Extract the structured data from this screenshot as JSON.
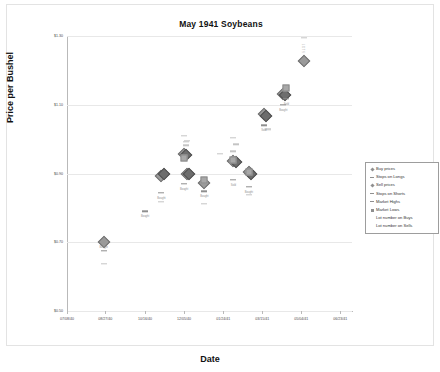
{
  "chart_data": {
    "type": "scatter",
    "title": "May 1941 Soybeans",
    "xlabel": "Date",
    "ylabel": "Price per Bushel",
    "grid": true,
    "legend_position": "right",
    "ylim": [
      0.5,
      1.3
    ],
    "y_ticks": [
      "$0.50",
      "$0.70",
      "$0.90",
      "$1.10",
      "$1.30"
    ],
    "y_tick_values": [
      0.5,
      0.7,
      0.9,
      1.1,
      1.3
    ],
    "x_ticks": [
      "07/08/40",
      "08/27/40",
      "10/16/40",
      "12/05/40",
      "01/24/41",
      "03/15/41",
      "05/04/41",
      "06/23/41"
    ],
    "x_tick_positions": [
      0,
      49,
      100,
      150,
      200,
      250,
      300,
      350
    ],
    "xlim": [
      0,
      365
    ],
    "legend": [
      {
        "label": "Buy prices",
        "key": "diamond"
      },
      {
        "label": "Stops on Longs",
        "key": "dash"
      },
      {
        "label": "Sell prices",
        "key": "diamond"
      },
      {
        "label": "Stops on Shorts",
        "key": "dash"
      },
      {
        "label": "Market Highs",
        "key": "dash"
      },
      {
        "label": "Market Lows",
        "key": "square"
      },
      {
        "label": "Lot number on Buys",
        "key": "blank"
      },
      {
        "label": "Lot number on Sells",
        "key": "blank"
      }
    ],
    "series": [
      {
        "name": "Buy prices",
        "marker": "diamond",
        "points": [
          {
            "x": 47,
            "y": 0.7,
            "label": "Bought"
          },
          {
            "x": 121,
            "y": 0.893,
            "label": "Bought"
          },
          {
            "x": 150,
            "y": 0.958,
            "label": "Bought"
          },
          {
            "x": 154,
            "y": 0.9,
            "label": "Bought"
          },
          {
            "x": 176,
            "y": 0.873,
            "label": "Bought"
          },
          {
            "x": 213,
            "y": 0.935,
            "label": "Bought"
          },
          {
            "x": 233,
            "y": 0.903,
            "label": "Bought"
          },
          {
            "x": 252,
            "y": 1.072,
            "label": "Bought"
          },
          {
            "x": 277,
            "y": 1.132,
            "label": "Bought"
          },
          {
            "x": 303,
            "y": 1.228,
            "label": "Bought"
          }
        ]
      },
      {
        "name": "Sell prices",
        "marker": "diamond-dark",
        "points": [
          {
            "x": 124,
            "y": 0.9,
            "label": "Sold"
          },
          {
            "x": 152,
            "y": 0.955,
            "label": "Sold"
          },
          {
            "x": 156,
            "y": 0.898,
            "label": "Sold"
          },
          {
            "x": 216,
            "y": 0.933,
            "label": "Sold"
          },
          {
            "x": 236,
            "y": 0.9,
            "label": "Sold"
          },
          {
            "x": 255,
            "y": 1.068,
            "label": "Sold"
          },
          {
            "x": 279,
            "y": 1.128,
            "label": "Sold"
          }
        ]
      },
      {
        "name": "Stops on Longs",
        "marker": "dash",
        "points": [
          {
            "x": 47,
            "y": 0.676
          },
          {
            "x": 100,
            "y": 0.79
          },
          {
            "x": 121,
            "y": 0.843
          },
          {
            "x": 150,
            "y": 0.87
          },
          {
            "x": 176,
            "y": 0.848
          },
          {
            "x": 213,
            "y": 0.882
          },
          {
            "x": 233,
            "y": 0.862
          },
          {
            "x": 252,
            "y": 1.04
          },
          {
            "x": 277,
            "y": 1.1
          },
          {
            "x": 281,
            "y": 1.118
          }
        ]
      },
      {
        "name": "Stops on Shorts",
        "marker": "dash-light",
        "points": [
          {
            "x": 47,
            "y": 0.638
          },
          {
            "x": 121,
            "y": 0.818
          },
          {
            "x": 152,
            "y": 0.982
          },
          {
            "x": 154,
            "y": 0.995
          },
          {
            "x": 176,
            "y": 0.812
          },
          {
            "x": 213,
            "y": 0.965
          },
          {
            "x": 233,
            "y": 0.838
          },
          {
            "x": 258,
            "y": 1.028
          }
        ]
      },
      {
        "name": "Market Highs",
        "marker": "dash-light",
        "points": [
          {
            "x": 150,
            "y": 1.01
          },
          {
            "x": 152,
            "y": 0.993
          },
          {
            "x": 196,
            "y": 0.958
          },
          {
            "x": 213,
            "y": 1.003
          },
          {
            "x": 216,
            "y": 0.985
          },
          {
            "x": 258,
            "y": 1.03
          },
          {
            "x": 303,
            "y": 1.295
          }
        ]
      },
      {
        "name": "Market Lows",
        "marker": "square",
        "points": [
          {
            "x": 150,
            "y": 0.945
          },
          {
            "x": 176,
            "y": 0.88
          },
          {
            "x": 213,
            "y": 0.94
          },
          {
            "x": 233,
            "y": 0.905
          },
          {
            "x": 281,
            "y": 1.148
          }
        ]
      },
      {
        "name": "Lot number on Buys",
        "marker": "text",
        "points": [
          {
            "x": 303,
            "y": 1.278,
            "label": "L O T S"
          }
        ]
      }
    ],
    "annotations": [
      {
        "x": 47,
        "y": 0.7,
        "text": "Bought"
      },
      {
        "x": 100,
        "y": 0.79,
        "text": "Bought"
      },
      {
        "x": 121,
        "y": 0.843,
        "text": "Bought"
      },
      {
        "x": 150,
        "y": 0.87,
        "text": "Bought"
      },
      {
        "x": 176,
        "y": 0.848,
        "text": "Bought"
      },
      {
        "x": 213,
        "y": 0.882,
        "text": "Sold"
      },
      {
        "x": 233,
        "y": 0.862,
        "text": "Bought"
      },
      {
        "x": 252,
        "y": 1.04,
        "text": "Sold"
      },
      {
        "x": 277,
        "y": 1.1,
        "text": "Bought"
      },
      {
        "x": 281,
        "y": 1.118,
        "text": "Sold"
      }
    ]
  }
}
